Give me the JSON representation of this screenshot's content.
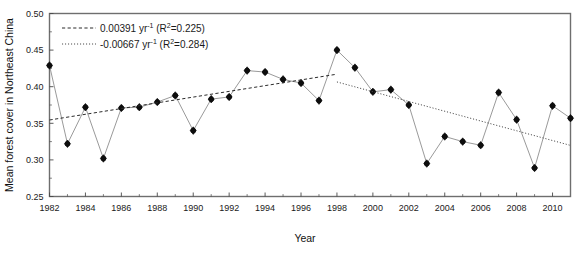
{
  "chart_data": {
    "type": "line",
    "title": "",
    "xlabel": "Year",
    "ylabel": "Mean forest cover in Northeast China",
    "xlim": [
      1982,
      2011
    ],
    "ylim": [
      0.25,
      0.5
    ],
    "grid": false,
    "legend_position": "top-left",
    "x": [
      1982,
      1983,
      1984,
      1985,
      1986,
      1987,
      1988,
      1989,
      1990,
      1991,
      1992,
      1993,
      1994,
      1995,
      1996,
      1997,
      1998,
      1999,
      2000,
      2001,
      2002,
      2003,
      2004,
      2005,
      2006,
      2007,
      2008,
      2009,
      2010,
      2011
    ],
    "series": [
      {
        "name": "Mean forest cover",
        "values": [
          0.429,
          0.322,
          0.372,
          0.302,
          0.371,
          0.372,
          0.379,
          0.388,
          0.34,
          0.383,
          0.386,
          0.422,
          0.42,
          0.41,
          0.405,
          0.381,
          0.45,
          0.426,
          0.393,
          0.396,
          0.375,
          0.295,
          0.332,
          0.325,
          0.32,
          0.392,
          0.355,
          0.289,
          0.374,
          0.357
        ]
      }
    ],
    "xticks": [
      1982,
      1984,
      1986,
      1988,
      1990,
      1992,
      1994,
      1996,
      1998,
      2000,
      2002,
      2004,
      2006,
      2008,
      2010
    ],
    "xtick_labels": [
      "1982",
      "1984",
      "1986",
      "1988",
      "1990",
      "1992",
      "1994",
      "1996",
      "1998",
      "2000",
      "2002",
      "2004",
      "2006",
      "2008",
      "2010"
    ],
    "yticks": [
      0.25,
      0.3,
      0.35,
      0.4,
      0.45,
      0.5
    ],
    "ytick_labels": [
      "0.25",
      "0.30",
      "0.35",
      "0.40",
      "0.45",
      "0.50"
    ],
    "trends": [
      {
        "name": "increasing-trend",
        "style": "dashed",
        "slope": 0.00391,
        "r2": 0.225,
        "x_start": 1982,
        "x_end": 1998,
        "y_start": 0.3545,
        "y_end": 0.4171
      },
      {
        "name": "decreasing-trend",
        "style": "dotted",
        "slope": -0.00667,
        "r2": 0.284,
        "x_start": 1998,
        "x_end": 2011,
        "y_start": 0.4065,
        "y_end": 0.3198
      }
    ],
    "annotations": []
  },
  "legend": {
    "entries": [
      {
        "style": "dashed",
        "slope_text": "0.00391 yr",
        "unit_exponent": "-1",
        "stat_open": " (R",
        "stat_exponent": "2",
        "stat_close": "=0.225)"
      },
      {
        "style": "dotted",
        "slope_text": "-0.00667 yr",
        "unit_exponent": "-1",
        "stat_open": " (R",
        "stat_exponent": "2",
        "stat_close": "=0.284)"
      }
    ]
  },
  "axes": {
    "x_title": "Year",
    "y_title": "Mean forest cover in Northeast China"
  }
}
